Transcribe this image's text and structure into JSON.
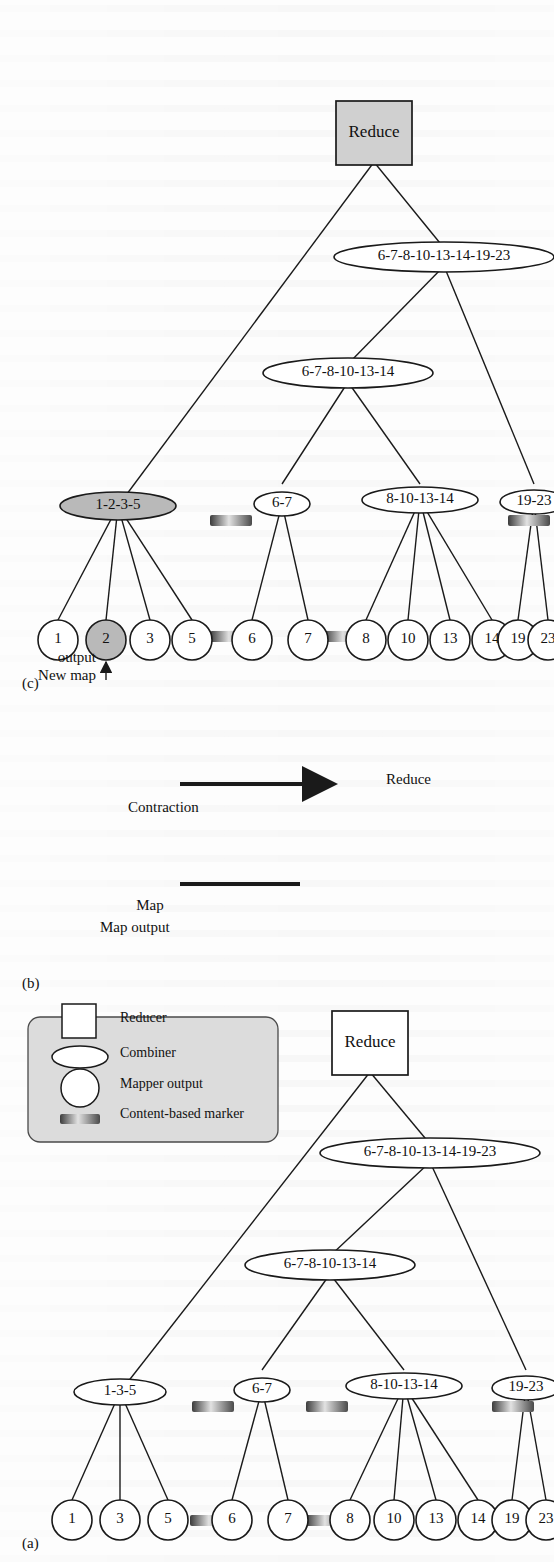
{
  "figure": {
    "orientation": "rotated-90-ccw",
    "panels": [
      {
        "id": "a",
        "label": "(a)"
      },
      {
        "id": "b",
        "label": "(b)"
      },
      {
        "id": "c",
        "label": "(c)"
      }
    ]
  },
  "colors": {
    "ink": "#1a1a1a",
    "paper": "#fdfdfd",
    "shade_node": "#b9b9b9",
    "shade_reduce": "#d0d0d0",
    "legend_fill": "#dcdcdc",
    "marker_dark": "#3a3a3a",
    "marker_light": "#d9d9d9"
  },
  "panel_a": {
    "label": "(a)",
    "mapper_outputs": [
      "1",
      "3",
      "5",
      "6",
      "7",
      "8",
      "10",
      "13",
      "14",
      "19",
      "23"
    ],
    "combiners_level1": [
      "1-3-5",
      "6-7",
      "8-10-13-14",
      "19-23"
    ],
    "combiners_level2": [
      "6-7-8-10-13-14"
    ],
    "combiners_level3": [
      "6-7-8-10-13-14-19-23"
    ],
    "reducer": "Reduce",
    "marker_count": 6,
    "legend": {
      "title": "",
      "items": [
        {
          "label": "Content-based marker",
          "shape": "bar"
        },
        {
          "label": "Mapper output",
          "shape": "circle"
        },
        {
          "label": "Combiner",
          "shape": "ellipse"
        },
        {
          "label": "Reducer",
          "shape": "square"
        }
      ]
    }
  },
  "panel_b": {
    "label": "(b)",
    "line_label": "Map output",
    "arrow_label": "Contraction",
    "arrow_target": "Reduce"
  },
  "panel_c": {
    "label": "(c)",
    "annotation": "New map output",
    "annotated_node": "2",
    "mapper_outputs": [
      "1",
      "2",
      "3",
      "5",
      "6",
      "7",
      "8",
      "10",
      "13",
      "14",
      "19",
      "23"
    ],
    "shaded_mapper_outputs": [
      "2"
    ],
    "combiners_level1": [
      "1-2-3-5",
      "6-7",
      "8-10-13-14",
      "19-23"
    ],
    "shaded_combiners": [
      "1-2-3-5"
    ],
    "combiners_level2": [
      "6-7-8-10-13-14"
    ],
    "combiners_level3": [
      "6-7-8-10-13-14-19-23"
    ],
    "reducer": "Reduce",
    "marker_count": 5
  }
}
